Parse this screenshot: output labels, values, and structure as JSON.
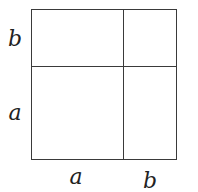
{
  "diagram": {
    "title": "",
    "line_color": "#3a3a3a",
    "labels": {
      "left_top": "b",
      "left_bottom": "a",
      "bottom_left": "a",
      "bottom_right": "b"
    },
    "regions": [
      {
        "name": "top-left",
        "width": "a",
        "height": "b"
      },
      {
        "name": "top-right",
        "width": "b",
        "height": "b"
      },
      {
        "name": "bottom-left",
        "width": "a",
        "height": "a"
      },
      {
        "name": "bottom-right",
        "width": "b",
        "height": "a"
      }
    ]
  }
}
